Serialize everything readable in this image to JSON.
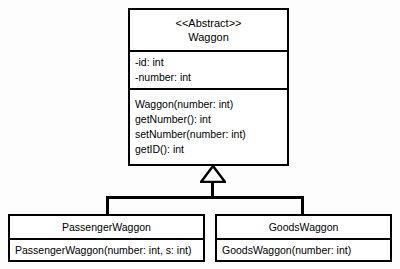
{
  "diagram": {
    "type": "uml-class-diagram",
    "relationship": "generalization"
  },
  "base_class": {
    "stereotype": "<<Abstract>>",
    "name": "Waggon",
    "attributes": [
      "-id: int",
      "-number: int"
    ],
    "operations": [
      "Waggon(number: int)",
      "getNumber(): int",
      "setNumber(number: int)",
      "getID(): int"
    ]
  },
  "subclasses": [
    {
      "name": "PassengerWaggon",
      "operations": [
        "PassengerWaggon(number: int, s: int)"
      ]
    },
    {
      "name": "GoodsWaggon",
      "operations": [
        "GoodsWaggon(number: int)"
      ]
    }
  ],
  "colors": {
    "line": "#000000",
    "fill": "#ffffff",
    "background": "#fdfdfd",
    "text": "#000000"
  }
}
